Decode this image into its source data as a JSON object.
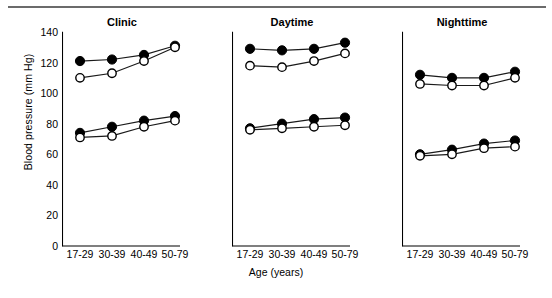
{
  "figure": {
    "ylabel": "Blood pressure (mm Hg)",
    "xlabel": "Age (years)",
    "yticks": [
      0,
      20,
      40,
      60,
      80,
      100,
      120,
      140
    ],
    "ytick_labels": [
      "0",
      "20",
      "40",
      "60",
      "80",
      "100",
      "120",
      "140"
    ],
    "categories": [
      "17-29",
      "30-39",
      "40-49",
      "50-79"
    ],
    "ylim": [
      0,
      140
    ],
    "grid": false,
    "legend": "none",
    "marker_filled": "filled-circle",
    "marker_open": "open-circle",
    "line_color": "#1a1a1a",
    "background": "#ffffff"
  },
  "panels": [
    {
      "title": "Clinic"
    },
    {
      "title": "Daytime"
    },
    {
      "title": "Nighttime"
    }
  ],
  "chart_data": {
    "type": "line",
    "title": "",
    "xlabel": "Age (years)",
    "ylabel": "Blood pressure (mm Hg)",
    "ylim": [
      0,
      140
    ],
    "yticks": [
      0,
      20,
      40,
      60,
      80,
      100,
      120,
      140
    ],
    "categories": [
      "17-29",
      "30-39",
      "40-49",
      "50-79"
    ],
    "grid": false,
    "legend_position": "none",
    "panels": [
      {
        "title": "Clinic",
        "series": [
          {
            "name": "Systolic filled",
            "marker": "filled-circle",
            "values": [
              121,
              122,
              125,
              131
            ]
          },
          {
            "name": "Systolic open",
            "marker": "open-circle",
            "values": [
              110,
              113,
              121,
              130
            ]
          },
          {
            "name": "Diastolic filled",
            "marker": "filled-circle",
            "values": [
              74,
              78,
              82,
              85
            ]
          },
          {
            "name": "Diastolic open",
            "marker": "open-circle",
            "values": [
              71,
              72,
              78,
              82
            ]
          }
        ]
      },
      {
        "title": "Daytime",
        "series": [
          {
            "name": "Systolic filled",
            "marker": "filled-circle",
            "values": [
              129,
              128,
              129,
              133
            ]
          },
          {
            "name": "Systolic open",
            "marker": "open-circle",
            "values": [
              118,
              117,
              121,
              126
            ]
          },
          {
            "name": "Diastolic filled",
            "marker": "filled-circle",
            "values": [
              77,
              80,
              83,
              84
            ]
          },
          {
            "name": "Diastolic open",
            "marker": "open-circle",
            "values": [
              76,
              77,
              78,
              79
            ]
          }
        ]
      },
      {
        "title": "Nighttime",
        "series": [
          {
            "name": "Systolic filled",
            "marker": "filled-circle",
            "values": [
              112,
              110,
              110,
              114
            ]
          },
          {
            "name": "Systolic open",
            "marker": "open-circle",
            "values": [
              106,
              105,
              105,
              110
            ]
          },
          {
            "name": "Diastolic filled",
            "marker": "filled-circle",
            "values": [
              60,
              63,
              67,
              69
            ]
          },
          {
            "name": "Diastolic open",
            "marker": "open-circle",
            "values": [
              59,
              60,
              64,
              65
            ]
          }
        ]
      }
    ]
  }
}
